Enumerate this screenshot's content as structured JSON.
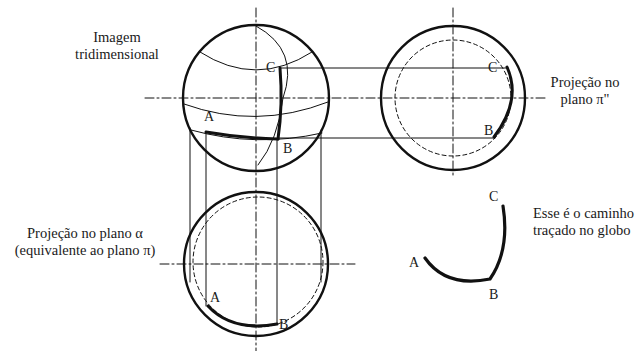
{
  "labels": {
    "three_d": [
      "Imagem",
      "tridimensional"
    ],
    "projection_pi2": [
      "Projeção no",
      "plano π\""
    ],
    "projection_alpha": [
      "Projeção no plano α",
      "(equivalente ao plano π)"
    ],
    "path_caption": [
      "Esse é o caminho",
      "traçado no globo"
    ]
  },
  "points": {
    "sphere": {
      "A": "A",
      "B": "B",
      "C": "C"
    },
    "right_projection": {
      "B": "B",
      "C": "C"
    },
    "bottom_projection": {
      "A": "A",
      "B": "B"
    },
    "path": {
      "A": "A",
      "B": "B",
      "C": "C"
    }
  },
  "colors": {
    "line": "#111111",
    "background": "#ffffff"
  }
}
